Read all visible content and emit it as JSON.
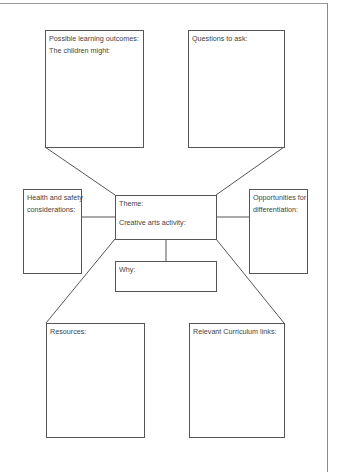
{
  "diagram": {
    "boxes": {
      "learning_outcomes": {
        "line1": "Possible learning outcomes:",
        "line2": "The children might:"
      },
      "questions": {
        "label": "Questions to ask:"
      },
      "health_safety": {
        "line1": "Health and safety",
        "line2": "considerations:"
      },
      "opportunities": {
        "line1": "Opportunities for",
        "line2": "differentiation:"
      },
      "central": {
        "theme": "Theme:",
        "activity": "Creative arts activity:"
      },
      "why": {
        "label": "Why:"
      },
      "resources": {
        "label": "Resources:"
      },
      "curriculum": {
        "label": "Relevant Curriculum links:"
      }
    },
    "colors": {
      "line": "#555555",
      "text": "#444444",
      "frame": "#9a9a9a",
      "background": "#ffffff"
    }
  }
}
